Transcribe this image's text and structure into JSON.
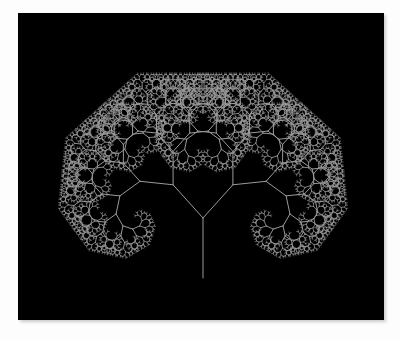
{
  "figure": {
    "background_color": "#000000",
    "page_background_color": "#fdfdfd",
    "line_color": "#9a9a9a",
    "border_color": "#c8c8c8",
    "panel": {
      "x": 18,
      "y": 13,
      "width": 366,
      "height": 307
    }
  },
  "chart_data": {
    "type": "line",
    "title": "",
    "subtitle": "",
    "xlabel": "",
    "ylabel": "",
    "grid": false,
    "legend": null,
    "annotations": [],
    "figure_kind": "fractal-canopy-binary-tree",
    "parameters": {
      "trunk_base_x": 203,
      "trunk_base_y": 278,
      "trunk_top_y": 218,
      "trunk_length": 60,
      "branch_angle_degrees": 42,
      "length_ratio": 0.745,
      "recursion_depth": 12,
      "initial_heading_degrees": 90,
      "stroke_width": 1.0
    },
    "extents": {
      "canopy_left_x": 48,
      "canopy_right_x": 357,
      "canopy_top_y": 58,
      "canopy_bottom_y": 278,
      "canopy_center_x": 202
    },
    "series": [
      {
        "name": "trunk",
        "level": 0,
        "segment_count": 1,
        "segment_length": 60
      },
      {
        "name": "branches-level-1",
        "level": 1,
        "segment_count": 2,
        "segment_length": 44.7
      },
      {
        "name": "branches-level-2",
        "level": 2,
        "segment_count": 4,
        "segment_length": 33.3
      },
      {
        "name": "branches-level-3",
        "level": 3,
        "segment_count": 8,
        "segment_length": 24.8
      },
      {
        "name": "branches-level-4",
        "level": 4,
        "segment_count": 16,
        "segment_length": 18.5
      },
      {
        "name": "branches-level-5",
        "level": 5,
        "segment_count": 32,
        "segment_length": 13.8
      },
      {
        "name": "branches-level-6",
        "level": 6,
        "segment_count": 64,
        "segment_length": 10.3
      },
      {
        "name": "branches-level-7",
        "level": 7,
        "segment_count": 128,
        "segment_length": 7.6
      },
      {
        "name": "branches-level-8",
        "level": 8,
        "segment_count": 256,
        "segment_length": 5.7
      },
      {
        "name": "branches-level-9",
        "level": 9,
        "segment_count": 512,
        "segment_length": 4.2
      },
      {
        "name": "branches-level-10",
        "level": 10,
        "segment_count": 1024,
        "segment_length": 3.2
      },
      {
        "name": "branches-level-11",
        "level": 11,
        "segment_count": 2048,
        "segment_length": 2.3
      },
      {
        "name": "branches-level-12",
        "level": 12,
        "segment_count": 4096,
        "segment_length": 1.8
      }
    ]
  }
}
